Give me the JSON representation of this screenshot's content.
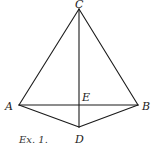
{
  "figure": {
    "caption": "Ex. 1.",
    "colors": {
      "line": "#1a1a1a",
      "label": "#222222",
      "background": "#ffffff"
    },
    "points": {
      "A": {
        "label": "A",
        "x": 19,
        "y": 105
      },
      "B": {
        "label": "B",
        "x": 138,
        "y": 105
      },
      "C": {
        "label": "C",
        "x": 79,
        "y": 9
      },
      "D": {
        "label": "D",
        "x": 79,
        "y": 127
      },
      "E": {
        "label": "E",
        "x": 79,
        "y": 105
      }
    },
    "segments": [
      "CA",
      "CB",
      "CD",
      "AB",
      "AD",
      "BD"
    ]
  }
}
